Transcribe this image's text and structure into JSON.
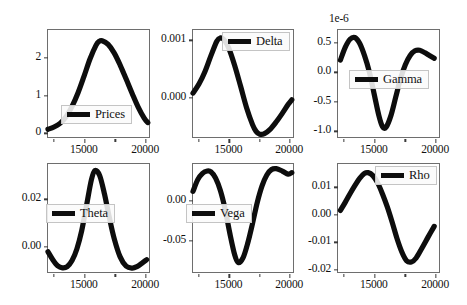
{
  "figure": {
    "width": 467,
    "height": 305,
    "background": "#ffffff",
    "line_color": "#0d0d0d",
    "frame_color": "#6e6e6e",
    "rows": 2,
    "cols": 3
  },
  "chart_data": [
    {
      "id": "prices",
      "type": "line",
      "title": "",
      "xlabel": "",
      "ylabel": "",
      "legend": "Prices",
      "legend_position": "lower center",
      "grid": false,
      "xlim": [
        12000,
        20400
      ],
      "ylim": [
        -0.15,
        2.75
      ],
      "xticks": [
        15000,
        20000
      ],
      "xticklabels": [
        "15000",
        "20000"
      ],
      "yticks": [
        0,
        1,
        2
      ],
      "yticklabels": [
        "0",
        "1",
        "2"
      ],
      "offset_text": "",
      "x": [
        12000,
        12500,
        13000,
        13500,
        14000,
        14500,
        15000,
        15500,
        16000,
        16250,
        16500,
        17000,
        17500,
        18000,
        18500,
        19000,
        19500,
        20000,
        20300
      ],
      "y": [
        0.06,
        0.12,
        0.22,
        0.4,
        0.68,
        1.05,
        1.5,
        1.97,
        2.34,
        2.44,
        2.46,
        2.36,
        2.13,
        1.8,
        1.42,
        1.03,
        0.66,
        0.36,
        0.24
      ]
    },
    {
      "id": "delta",
      "type": "line",
      "title": "",
      "xlabel": "",
      "ylabel": "",
      "legend": "Delta",
      "legend_position": "upper right",
      "grid": false,
      "xlim": [
        12000,
        20400
      ],
      "ylim": [
        -0.00072,
        0.00118
      ],
      "xticks": [
        15000,
        20000
      ],
      "xticklabels": [
        "15000",
        "20000"
      ],
      "yticks": [
        0.0,
        0.001
      ],
      "yticklabels": [
        "0.000",
        "0.001"
      ],
      "offset_text": "",
      "x": [
        12000,
        12500,
        13000,
        13500,
        14000,
        14300,
        14600,
        15000,
        15500,
        16000,
        16500,
        17000,
        17300,
        17600,
        18000,
        18500,
        19000,
        19500,
        20000,
        20300
      ],
      "y": [
        6e-05,
        0.00022,
        0.00044,
        0.00072,
        0.00098,
        0.00104,
        0.00101,
        0.00086,
        0.00055,
        0.00018,
        -0.0002,
        -0.0005,
        -0.00062,
        -0.00067,
        -0.00066,
        -0.00058,
        -0.00045,
        -0.0003,
        -0.00014,
        -6e-05
      ]
    },
    {
      "id": "gamma",
      "type": "line",
      "title": "",
      "xlabel": "",
      "ylabel": "",
      "legend": "Gamma",
      "legend_position": "center",
      "grid": false,
      "xlim": [
        12000,
        20400
      ],
      "ylim": [
        -1.13,
        0.72
      ],
      "xticks": [
        15000,
        20000
      ],
      "xticklabels": [
        "15000",
        "20000"
      ],
      "yticks": [
        -1.0,
        -0.5,
        0.0,
        0.5
      ],
      "yticklabels": [
        "-1.0",
        "-0.5",
        "0.0",
        "0.5"
      ],
      "offset_text": "1e-6",
      "x": [
        12200,
        12600,
        13000,
        13400,
        13800,
        14200,
        14600,
        15000,
        15400,
        15700,
        16000,
        16400,
        16800,
        17200,
        17600,
        18000,
        18400,
        18800,
        19200,
        19600,
        20000
      ],
      "y": [
        0.2,
        0.42,
        0.56,
        0.59,
        0.49,
        0.28,
        0.0,
        -0.38,
        -0.76,
        -0.95,
        -0.96,
        -0.76,
        -0.44,
        -0.12,
        0.12,
        0.28,
        0.36,
        0.37,
        0.33,
        0.28,
        0.23
      ]
    },
    {
      "id": "theta",
      "type": "line",
      "title": "",
      "xlabel": "",
      "ylabel": "",
      "legend": "Theta",
      "legend_position": "center left",
      "grid": false,
      "xlim": [
        12000,
        20400
      ],
      "ylim": [
        -0.0115,
        0.035
      ],
      "xticks": [
        15000,
        20000
      ],
      "xticklabels": [
        "15000",
        "20000"
      ],
      "yticks": [
        0.0,
        0.02
      ],
      "yticklabels": [
        "0.00",
        "0.02"
      ],
      "offset_text": "",
      "x": [
        12000,
        12400,
        12800,
        13200,
        13600,
        14000,
        14400,
        14800,
        15200,
        15600,
        15900,
        16300,
        16700,
        17100,
        17500,
        18000,
        18500,
        19000,
        19400,
        19800,
        20200
      ],
      "y": [
        -0.0028,
        -0.0062,
        -0.0088,
        -0.0097,
        -0.0092,
        -0.0066,
        -0.0016,
        0.0062,
        0.017,
        0.028,
        0.0322,
        0.03,
        0.022,
        0.012,
        0.003,
        -0.005,
        -0.009,
        -0.0098,
        -0.0092,
        -0.0078,
        -0.0062
      ]
    },
    {
      "id": "vega",
      "type": "line",
      "title": "",
      "xlabel": "",
      "ylabel": "",
      "legend": "Vega",
      "legend_position": "center left",
      "grid": false,
      "xlim": [
        12000,
        20400
      ],
      "ylim": [
        -0.092,
        0.046
      ],
      "xticks": [
        15000,
        20000
      ],
      "xticklabels": [
        "15000",
        "20000"
      ],
      "yticks": [
        -0.05,
        0.0
      ],
      "yticklabels": [
        "-0.05",
        "0.00"
      ],
      "offset_text": "",
      "x": [
        12000,
        12400,
        12800,
        13200,
        13500,
        13900,
        14300,
        14700,
        15100,
        15500,
        15800,
        16200,
        16600,
        17000,
        17400,
        17800,
        18200,
        18600,
        19000,
        19500,
        20000,
        20300
      ],
      "y": [
        0.011,
        0.026,
        0.034,
        0.037,
        0.036,
        0.028,
        0.012,
        -0.012,
        -0.043,
        -0.07,
        -0.08,
        -0.074,
        -0.055,
        -0.03,
        -0.003,
        0.018,
        0.032,
        0.039,
        0.04,
        0.037,
        0.033,
        0.035
      ]
    },
    {
      "id": "rho",
      "type": "line",
      "title": "",
      "xlabel": "",
      "ylabel": "",
      "legend": "Rho",
      "legend_position": "upper right",
      "grid": false,
      "xlim": [
        12000,
        20400
      ],
      "ylim": [
        -0.0215,
        0.0185
      ],
      "xticks": [
        15000,
        20000
      ],
      "xticklabels": [
        "15000",
        "20000"
      ],
      "yticks": [
        -0.02,
        -0.01,
        0.0,
        0.01
      ],
      "yticklabels": [
        "-0.02",
        "-0.01",
        "0.00",
        "0.01"
      ],
      "offset_text": "",
      "x": [
        12200,
        12600,
        13000,
        13400,
        13800,
        14200,
        14500,
        14900,
        15300,
        15700,
        16100,
        16500,
        16900,
        17300,
        17700,
        18100,
        18500,
        19000,
        19500,
        20000
      ],
      "y": [
        0.0013,
        0.0043,
        0.0075,
        0.0105,
        0.0132,
        0.015,
        0.0153,
        0.0142,
        0.0115,
        0.0074,
        0.0026,
        -0.003,
        -0.009,
        -0.014,
        -0.0173,
        -0.0178,
        -0.0163,
        -0.0125,
        -0.0085,
        -0.0046
      ]
    }
  ]
}
